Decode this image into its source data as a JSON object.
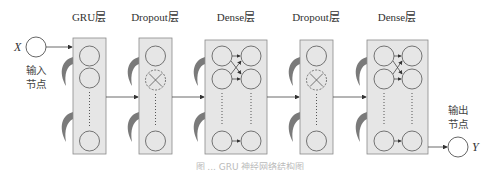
{
  "diagram": {
    "input": {
      "symbol": "X",
      "label_line1": "输入",
      "label_line2": "节点"
    },
    "output": {
      "symbol": "Y",
      "label_line1": "输出",
      "label_line2": "节点"
    },
    "layers": [
      {
        "name": "GRU层",
        "type": "gru"
      },
      {
        "name": "Dropout层",
        "type": "dropout"
      },
      {
        "name": "Dense层",
        "type": "dense"
      },
      {
        "name": "Dropout层",
        "type": "dropout"
      },
      {
        "name": "Dense层",
        "type": "dense"
      }
    ],
    "caption": "图 ... GRU 神经网络结构图"
  },
  "colors": {
    "box_fill": "#e6e6e6",
    "box_stroke": "#8a8a8a",
    "recurrent_arrow": "#777777",
    "line": "#444444"
  }
}
